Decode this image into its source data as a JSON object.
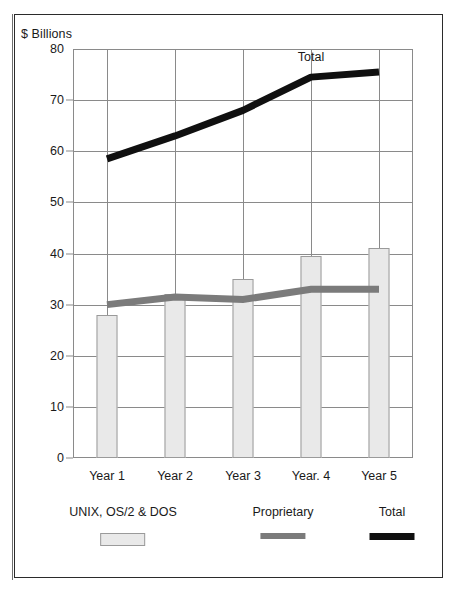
{
  "figure": {
    "axis_caption": "$ Billions",
    "annotation": "Total"
  },
  "legend": [
    {
      "label": "UNIX, OS/2 & DOS",
      "swatch": "light-box",
      "color": "#e9e9e9"
    },
    {
      "label": "Proprietary",
      "swatch": "grey-bar",
      "color": "#7b7b7b"
    },
    {
      "label": "Total",
      "swatch": "black-bar",
      "color": "#101010"
    }
  ],
  "chart_data": {
    "type": "bar",
    "title": "",
    "subtitle": "",
    "xlabel": "",
    "ylabel": "$ Billions",
    "categories": [
      "Year 1",
      "Year 2",
      "Year 3",
      "Year. 4",
      "Year 5"
    ],
    "ylim": [
      0,
      80
    ],
    "yticks": [
      0,
      10,
      20,
      30,
      40,
      50,
      60,
      70,
      80
    ],
    "ytick_labels": [
      "0",
      "10",
      "20",
      "30",
      "40",
      "50",
      "60",
      "70",
      "80"
    ],
    "grid": true,
    "legend_position": "below",
    "annotations": [
      {
        "text": "Total",
        "x_category": "Year. 4",
        "y": 78
      }
    ],
    "series": [
      {
        "name": "UNIX, OS/2 & DOS",
        "type": "bar",
        "color": "#e9e9e9",
        "values": [
          28,
          32,
          35,
          39.5,
          41
        ]
      },
      {
        "name": "Proprietary",
        "type": "line",
        "color": "#7b7b7b",
        "values": [
          30,
          31.5,
          31,
          33,
          33
        ]
      },
      {
        "name": "Total",
        "type": "line",
        "color": "#101010",
        "values": [
          58.5,
          63,
          68,
          74.5,
          75.5
        ]
      }
    ]
  }
}
